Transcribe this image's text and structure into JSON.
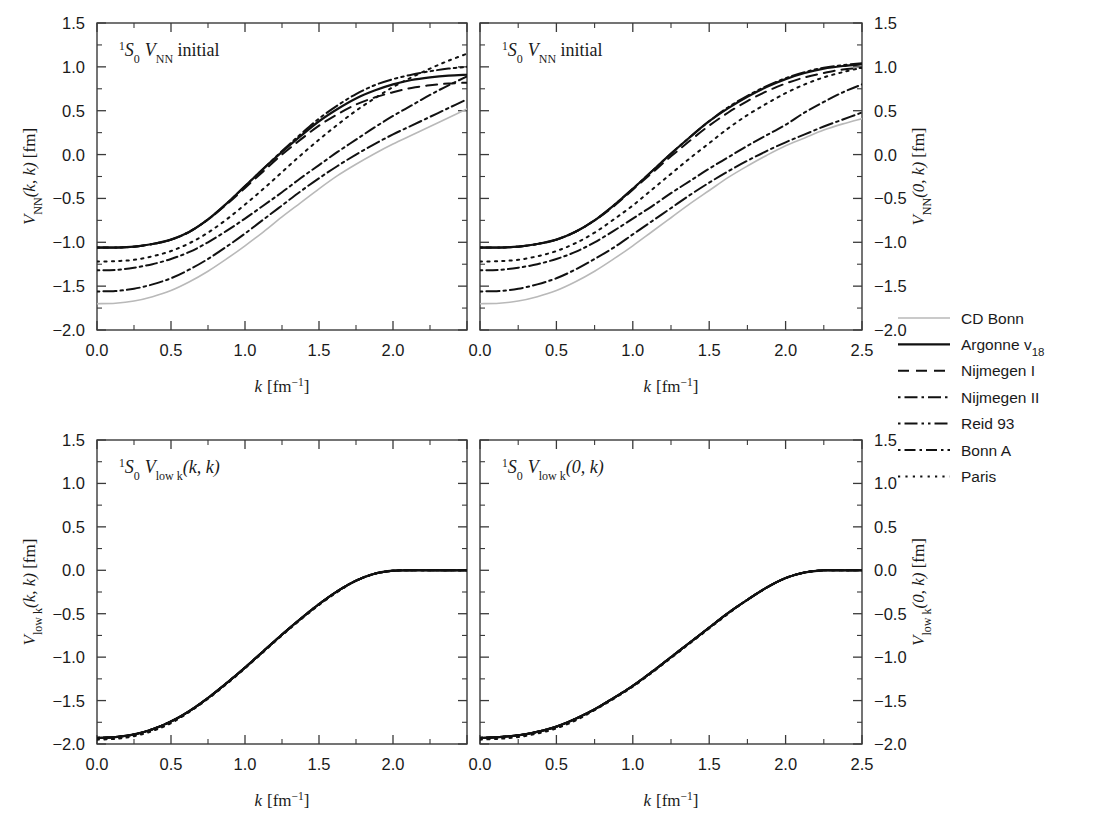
{
  "figure": {
    "background": "#ffffff",
    "axis_color": "#3a3a3a",
    "curve_color": "#111111",
    "cdbonn_color": "#b9b9b9"
  },
  "axes": {
    "x": {
      "label_main": "k",
      "label_unit": "[fm",
      "label_exp": "−1",
      "label_close": "]",
      "ticks": [
        "0.0",
        "0.5",
        "1.0",
        "1.5",
        "2.0",
        "2.5"
      ],
      "values": [
        0.0,
        0.5,
        1.0,
        1.5,
        2.0,
        2.5
      ],
      "range": [
        0.0,
        2.5
      ],
      "minor_ticks": [
        0.25,
        0.75,
        1.25,
        1.75,
        2.25
      ]
    },
    "y": {
      "ticks": [
        "1.5",
        "1.0",
        "0.5",
        "0.0",
        "−0.5",
        "−1.0",
        "−1.5",
        "−2.0"
      ],
      "values": [
        1.5,
        1.0,
        0.5,
        0.0,
        -0.5,
        -1.0,
        -1.5,
        -2.0
      ],
      "range": [
        -2.0,
        1.5
      ],
      "minor_ticks": [
        1.25,
        0.75,
        0.25,
        -0.25,
        -0.75,
        -1.25,
        -1.75
      ]
    }
  },
  "panels": [
    {
      "id": "top-left",
      "title_parts": {
        "pre_sup": "1",
        "term": "S",
        "sub": "0",
        "v": "V",
        "vsub": "NN",
        "rest": " initial"
      },
      "title_text": "1S0 VNN initial",
      "ylabel_parts": {
        "v": "V",
        "vsub": "NN",
        "args": "(k, k)",
        "unit": " [fm]"
      },
      "ylabel_text": "VNN(k, k) [fm]",
      "ylabel_side": "left",
      "xlabel_shown": true
    },
    {
      "id": "top-right",
      "title_parts": {
        "pre_sup": "1",
        "term": "S",
        "sub": "0",
        "v": "V",
        "vsub": "NN",
        "rest": " initial"
      },
      "title_text": "1S0 VNN initial",
      "ylabel_parts": {
        "v": "V",
        "vsub": "NN",
        "args": "(0, k)",
        "unit": " [fm]"
      },
      "ylabel_text": "VNN(0, k) [fm]",
      "ylabel_side": "right",
      "xlabel_shown": true
    },
    {
      "id": "bottom-left",
      "title_parts": {
        "pre_sup": "1",
        "term": "S",
        "sub": "0",
        "v": "V",
        "vsub": "low k",
        "rest": "(k, k)"
      },
      "title_text": "1S0 Vlow k(k, k)",
      "ylabel_parts": {
        "v": "V",
        "vsub": "low k",
        "args": "(k, k)",
        "unit": " [fm]"
      },
      "ylabel_text": "Vlow k(k, k) [fm]",
      "ylabel_side": "left",
      "xlabel_shown": true
    },
    {
      "id": "bottom-right",
      "title_parts": {
        "pre_sup": "1",
        "term": "S",
        "sub": "0",
        "v": "V",
        "vsub": "low k",
        "rest": "(0, k)"
      },
      "title_text": "1S0 Vlow k(0, k)",
      "ylabel_parts": {
        "v": "V",
        "vsub": "low k",
        "args": "(0, k)",
        "unit": " [fm]"
      },
      "ylabel_text": "Vlow k(0, k) [fm]",
      "ylabel_side": "right",
      "xlabel_shown": true
    }
  ],
  "legend": {
    "entries": [
      {
        "label": "CD Bonn",
        "style": "solid",
        "color": "#b9b9b9",
        "width": 1.6
      },
      {
        "label_main": "Argonne v",
        "label_sub": "18",
        "label": "Argonne v18",
        "style": "solid",
        "color": "#111111",
        "width": 2.2
      },
      {
        "label": "Nijmegen I",
        "style": "dashed",
        "color": "#111111",
        "width": 2.0
      },
      {
        "label": "Nijmegen II",
        "style": "dashdot",
        "color": "#111111",
        "width": 2.0
      },
      {
        "label": "Reid 93",
        "style": "dashdotdot",
        "color": "#111111",
        "width": 2.0
      },
      {
        "label": "Bonn A",
        "style": "dashdotdash",
        "color": "#111111",
        "width": 2.0
      },
      {
        "label": "Paris",
        "style": "dotted",
        "color": "#111111",
        "width": 2.0
      }
    ]
  },
  "chart_data": {
    "type": "line",
    "xlabel": "k [fm^-1]",
    "ylabel": "V [fm]",
    "xlim": [
      0.0,
      2.5
    ],
    "ylim": [
      -2.0,
      1.5
    ],
    "grid": false,
    "legend_position": "right-middle",
    "x": [
      0.0,
      0.125,
      0.25,
      0.375,
      0.5,
      0.625,
      0.75,
      0.875,
      1.0,
      1.125,
      1.25,
      1.375,
      1.5,
      1.625,
      1.75,
      1.875,
      2.0,
      2.125,
      2.25,
      2.375,
      2.5
    ],
    "panels": [
      {
        "panel": "top-left",
        "quantity": "V_NN(k,k)",
        "series": [
          {
            "name": "CD Bonn",
            "values": [
              -1.7,
              -1.695,
              -1.67,
              -1.62,
              -1.55,
              -1.45,
              -1.33,
              -1.19,
              -1.04,
              -0.88,
              -0.71,
              -0.55,
              -0.39,
              -0.24,
              -0.11,
              0.01,
              0.12,
              0.22,
              0.32,
              0.42,
              0.52
            ]
          },
          {
            "name": "Argonne v18",
            "values": [
              -1.06,
              -1.06,
              -1.05,
              -1.02,
              -0.97,
              -0.88,
              -0.74,
              -0.56,
              -0.36,
              -0.16,
              0.03,
              0.21,
              0.38,
              0.52,
              0.64,
              0.73,
              0.8,
              0.85,
              0.88,
              0.9,
              0.91
            ]
          },
          {
            "name": "Nijmegen I",
            "values": [
              -1.06,
              -1.06,
              -1.05,
              -1.02,
              -0.97,
              -0.88,
              -0.74,
              -0.57,
              -0.38,
              -0.19,
              0.0,
              0.17,
              0.33,
              0.46,
              0.57,
              0.65,
              0.71,
              0.76,
              0.79,
              0.81,
              0.82
            ]
          },
          {
            "name": "Nijmegen II",
            "values": [
              -1.56,
              -1.555,
              -1.53,
              -1.48,
              -1.41,
              -1.31,
              -1.19,
              -1.05,
              -0.9,
              -0.74,
              -0.58,
              -0.42,
              -0.27,
              -0.13,
              0.0,
              0.12,
              0.23,
              0.33,
              0.43,
              0.53,
              0.63
            ]
          },
          {
            "name": "Reid 93",
            "values": [
              -1.06,
              -1.06,
              -1.05,
              -1.02,
              -0.97,
              -0.88,
              -0.74,
              -0.56,
              -0.36,
              -0.16,
              0.04,
              0.23,
              0.41,
              0.56,
              0.69,
              0.79,
              0.86,
              0.91,
              0.95,
              0.98,
              1.0
            ]
          },
          {
            "name": "Bonn A",
            "values": [
              -1.32,
              -1.315,
              -1.29,
              -1.25,
              -1.19,
              -1.11,
              -1.0,
              -0.87,
              -0.73,
              -0.58,
              -0.43,
              -0.27,
              -0.12,
              0.03,
              0.17,
              0.31,
              0.44,
              0.56,
              0.68,
              0.79,
              0.89
            ]
          },
          {
            "name": "Paris",
            "values": [
              -1.22,
              -1.215,
              -1.2,
              -1.16,
              -1.1,
              -1.01,
              -0.89,
              -0.74,
              -0.57,
              -0.39,
              -0.2,
              -0.01,
              0.17,
              0.34,
              0.5,
              0.64,
              0.77,
              0.88,
              0.98,
              1.07,
              1.15
            ]
          }
        ]
      },
      {
        "panel": "top-right",
        "quantity": "V_NN(0,k)",
        "series": [
          {
            "name": "CD Bonn",
            "values": [
              -1.7,
              -1.695,
              -1.67,
              -1.62,
              -1.55,
              -1.45,
              -1.33,
              -1.19,
              -1.04,
              -0.88,
              -0.72,
              -0.56,
              -0.41,
              -0.26,
              -0.13,
              -0.01,
              0.1,
              0.19,
              0.28,
              0.35,
              0.41
            ]
          },
          {
            "name": "Argonne v18",
            "values": [
              -1.06,
              -1.06,
              -1.05,
              -1.02,
              -0.97,
              -0.88,
              -0.75,
              -0.58,
              -0.39,
              -0.19,
              0.01,
              0.2,
              0.38,
              0.53,
              0.66,
              0.77,
              0.86,
              0.93,
              0.98,
              1.01,
              1.03
            ]
          },
          {
            "name": "Nijmegen I",
            "values": [
              -1.06,
              -1.06,
              -1.05,
              -1.02,
              -0.97,
              -0.88,
              -0.75,
              -0.59,
              -0.4,
              -0.21,
              -0.02,
              0.16,
              0.33,
              0.48,
              0.61,
              0.72,
              0.81,
              0.88,
              0.93,
              0.97,
              0.99
            ]
          },
          {
            "name": "Nijmegen II",
            "values": [
              -1.56,
              -1.555,
              -1.53,
              -1.48,
              -1.41,
              -1.31,
              -1.19,
              -1.06,
              -0.91,
              -0.76,
              -0.61,
              -0.46,
              -0.32,
              -0.19,
              -0.07,
              0.04,
              0.14,
              0.23,
              0.32,
              0.4,
              0.48
            ]
          },
          {
            "name": "Reid 93",
            "values": [
              -1.06,
              -1.06,
              -1.05,
              -1.02,
              -0.97,
              -0.88,
              -0.75,
              -0.58,
              -0.39,
              -0.19,
              0.01,
              0.2,
              0.38,
              0.54,
              0.67,
              0.78,
              0.87,
              0.94,
              0.99,
              1.02,
              1.04
            ]
          },
          {
            "name": "Bonn A",
            "values": [
              -1.32,
              -1.315,
              -1.29,
              -1.25,
              -1.19,
              -1.11,
              -1.0,
              -0.87,
              -0.73,
              -0.59,
              -0.44,
              -0.3,
              -0.16,
              -0.03,
              0.1,
              0.22,
              0.34,
              0.48,
              0.6,
              0.71,
              0.8
            ]
          },
          {
            "name": "Paris",
            "values": [
              -1.22,
              -1.215,
              -1.2,
              -1.16,
              -1.1,
              -1.01,
              -0.89,
              -0.74,
              -0.58,
              -0.4,
              -0.22,
              -0.04,
              0.13,
              0.3,
              0.45,
              0.58,
              0.7,
              0.8,
              0.88,
              0.94,
              0.99
            ]
          }
        ]
      },
      {
        "panel": "bottom-left",
        "quantity": "V_low k(k,k)",
        "note": "all potentials collapse onto a single universal curve",
        "series": [
          {
            "name": "CD Bonn",
            "values": [
              -1.93,
              -1.92,
              -1.89,
              -1.83,
              -1.74,
              -1.62,
              -1.47,
              -1.3,
              -1.12,
              -0.93,
              -0.74,
              -0.56,
              -0.39,
              -0.24,
              -0.12,
              -0.04,
              -0.005,
              0.0,
              0.0,
              0.0,
              0.0
            ]
          },
          {
            "name": "Argonne v18",
            "values": [
              -1.93,
              -1.92,
              -1.89,
              -1.83,
              -1.74,
              -1.62,
              -1.47,
              -1.3,
              -1.12,
              -0.93,
              -0.74,
              -0.56,
              -0.39,
              -0.24,
              -0.12,
              -0.04,
              -0.005,
              0.0,
              0.0,
              0.0,
              0.0
            ]
          },
          {
            "name": "Nijmegen I",
            "values": [
              -1.93,
              -1.92,
              -1.89,
              -1.83,
              -1.74,
              -1.62,
              -1.47,
              -1.3,
              -1.12,
              -0.93,
              -0.74,
              -0.56,
              -0.39,
              -0.24,
              -0.12,
              -0.04,
              -0.005,
              0.0,
              0.0,
              0.0,
              0.0
            ]
          },
          {
            "name": "Nijmegen II",
            "values": [
              -1.93,
              -1.92,
              -1.89,
              -1.83,
              -1.74,
              -1.62,
              -1.47,
              -1.3,
              -1.12,
              -0.93,
              -0.74,
              -0.56,
              -0.39,
              -0.24,
              -0.12,
              -0.04,
              -0.005,
              0.0,
              0.0,
              0.0,
              0.0
            ]
          },
          {
            "name": "Reid 93",
            "values": [
              -1.93,
              -1.92,
              -1.89,
              -1.83,
              -1.74,
              -1.62,
              -1.47,
              -1.3,
              -1.12,
              -0.93,
              -0.74,
              -0.56,
              -0.39,
              -0.24,
              -0.12,
              -0.04,
              -0.005,
              0.0,
              0.0,
              0.0,
              0.0
            ]
          },
          {
            "name": "Bonn A",
            "values": [
              -1.93,
              -1.92,
              -1.89,
              -1.83,
              -1.74,
              -1.62,
              -1.47,
              -1.3,
              -1.12,
              -0.93,
              -0.74,
              -0.56,
              -0.39,
              -0.24,
              -0.12,
              -0.04,
              -0.005,
              0.0,
              0.0,
              0.0,
              0.0
            ]
          },
          {
            "name": "Paris",
            "values": [
              -1.95,
              -1.94,
              -1.91,
              -1.85,
              -1.76,
              -1.63,
              -1.48,
              -1.31,
              -1.13,
              -0.94,
              -0.75,
              -0.57,
              -0.4,
              -0.25,
              -0.12,
              -0.04,
              -0.005,
              0.0,
              0.0,
              0.0,
              0.0
            ]
          }
        ]
      },
      {
        "panel": "bottom-right",
        "quantity": "V_low k(0,k)",
        "note": "all potentials collapse onto a single universal curve",
        "series": [
          {
            "name": "CD Bonn",
            "values": [
              -1.93,
              -1.92,
              -1.9,
              -1.86,
              -1.8,
              -1.71,
              -1.6,
              -1.47,
              -1.33,
              -1.17,
              -1.0,
              -0.83,
              -0.66,
              -0.49,
              -0.34,
              -0.2,
              -0.09,
              -0.025,
              0.0,
              0.0,
              0.0
            ]
          },
          {
            "name": "Argonne v18",
            "values": [
              -1.93,
              -1.92,
              -1.9,
              -1.86,
              -1.8,
              -1.71,
              -1.6,
              -1.47,
              -1.33,
              -1.17,
              -1.0,
              -0.83,
              -0.66,
              -0.49,
              -0.34,
              -0.2,
              -0.09,
              -0.025,
              0.0,
              0.0,
              0.0
            ]
          },
          {
            "name": "Nijmegen I",
            "values": [
              -1.93,
              -1.92,
              -1.9,
              -1.86,
              -1.8,
              -1.71,
              -1.6,
              -1.47,
              -1.33,
              -1.17,
              -1.0,
              -0.83,
              -0.66,
              -0.49,
              -0.34,
              -0.2,
              -0.09,
              -0.025,
              0.0,
              0.0,
              0.0
            ]
          },
          {
            "name": "Nijmegen II",
            "values": [
              -1.93,
              -1.92,
              -1.9,
              -1.86,
              -1.8,
              -1.71,
              -1.6,
              -1.47,
              -1.33,
              -1.17,
              -1.0,
              -0.83,
              -0.66,
              -0.49,
              -0.34,
              -0.2,
              -0.09,
              -0.025,
              0.0,
              0.0,
              0.0
            ]
          },
          {
            "name": "Reid 93",
            "values": [
              -1.93,
              -1.92,
              -1.9,
              -1.86,
              -1.8,
              -1.71,
              -1.6,
              -1.47,
              -1.33,
              -1.17,
              -1.0,
              -0.83,
              -0.66,
              -0.49,
              -0.34,
              -0.2,
              -0.09,
              -0.025,
              0.0,
              0.0,
              0.0
            ]
          },
          {
            "name": "Bonn A",
            "values": [
              -1.93,
              -1.92,
              -1.9,
              -1.86,
              -1.8,
              -1.71,
              -1.6,
              -1.47,
              -1.33,
              -1.17,
              -1.0,
              -0.83,
              -0.66,
              -0.49,
              -0.34,
              -0.2,
              -0.09,
              -0.025,
              0.0,
              0.0,
              0.0
            ]
          },
          {
            "name": "Paris",
            "values": [
              -1.95,
              -1.94,
              -1.92,
              -1.88,
              -1.82,
              -1.73,
              -1.61,
              -1.48,
              -1.34,
              -1.18,
              -1.01,
              -0.84,
              -0.67,
              -0.5,
              -0.34,
              -0.2,
              -0.09,
              -0.025,
              0.0,
              0.0,
              0.0
            ]
          }
        ]
      }
    ]
  }
}
